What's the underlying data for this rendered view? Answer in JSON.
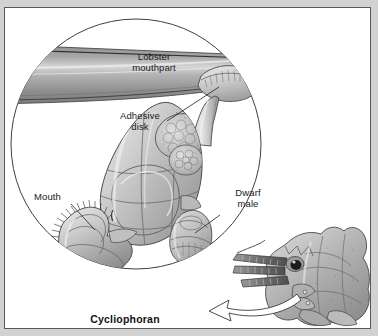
{
  "figure": {
    "caption": "Cycliophoran",
    "background_color": "#d2d2d2",
    "panel_color": "#ffffff",
    "border_color": "#58585a",
    "ink_color": "#1a1a1a"
  },
  "labels": {
    "lobster_mouthpart": "Lobster\nmouthpart",
    "adhesive_disk": "Adhesive\ndisk",
    "mouth": "Mouth",
    "dwarf_male": "Dwarf\nmale"
  },
  "parts": {
    "magnifier_circle": "magnified-view-circle",
    "lobster_head": "lobster-head-reference",
    "pointer_arrow": "magnification-arrow"
  }
}
